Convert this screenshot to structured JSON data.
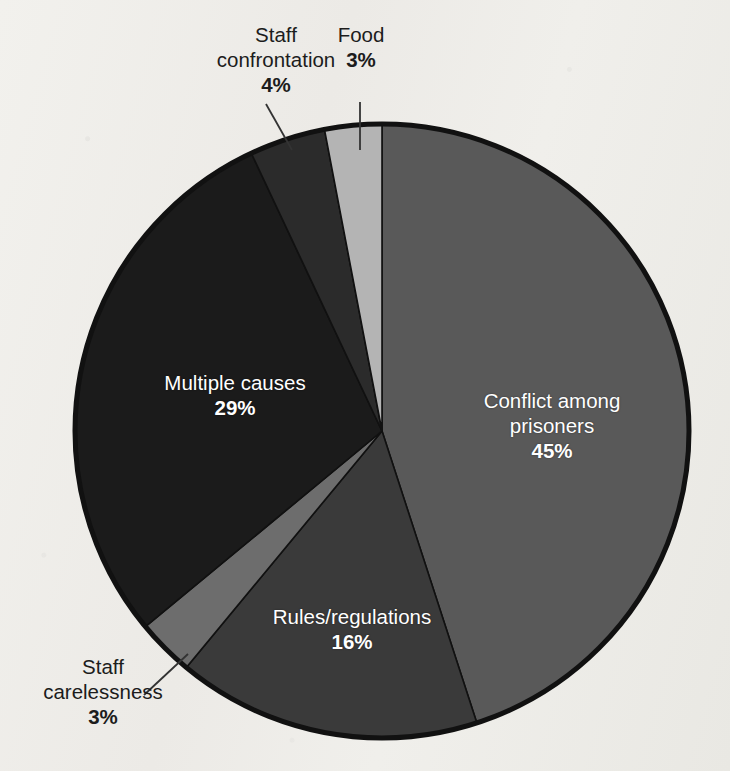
{
  "chart_data": {
    "type": "pie",
    "title": "",
    "subtitle": "",
    "xlabel": "",
    "ylabel": "",
    "legend_position": "none",
    "grid": false,
    "units": "percent",
    "total": 100,
    "categories": [
      "Conflict among prisoners",
      "Rules/regulations",
      "Staff carelessness",
      "Multiple causes",
      "Staff confrontation",
      "Food"
    ],
    "values": [
      45,
      16,
      3,
      29,
      4,
      3
    ],
    "slices": [
      {
        "id": "conflict",
        "label": "Conflict among prisoners",
        "label_line1": "Conflict among",
        "label_line2": "prisoners",
        "value": 45,
        "percent_text": "45%",
        "color": "#595959",
        "label_placement": "inside",
        "label_color": "#ffffff"
      },
      {
        "id": "rules",
        "label": "Rules/regulations",
        "label_line1": "Rules/regulations",
        "label_line2": "",
        "value": 16,
        "percent_text": "16%",
        "color": "#3a3a3a",
        "label_placement": "inside",
        "label_color": "#ffffff"
      },
      {
        "id": "staff-carelessness",
        "label": "Staff carelessness",
        "label_line1": "Staff",
        "label_line2": "carelessness",
        "value": 3,
        "percent_text": "3%",
        "color": "#6d6d6d",
        "label_placement": "outside",
        "label_color": "#1c1c1c"
      },
      {
        "id": "multiple",
        "label": "Multiple causes",
        "label_line1": "Multiple causes",
        "label_line2": "",
        "value": 29,
        "percent_text": "29%",
        "color": "#1b1b1b",
        "label_placement": "inside",
        "label_color": "#ffffff"
      },
      {
        "id": "staff-confrontation",
        "label": "Staff confrontation",
        "label_line1": "Staff",
        "label_line2": "confrontation",
        "value": 4,
        "percent_text": "4%",
        "color": "#2b2b2b",
        "label_placement": "outside",
        "label_color": "#1c1c1c"
      },
      {
        "id": "food",
        "label": "Food",
        "label_line1": "Food",
        "label_line2": "",
        "value": 3,
        "percent_text": "3%",
        "color": "#b4b4b4",
        "label_placement": "outside",
        "label_color": "#1c1c1c"
      }
    ],
    "geometry": {
      "center_x": 382,
      "center_y": 431,
      "radius": 307,
      "start_angle_deg": 0,
      "direction": "clockwise"
    },
    "style": {
      "background": "#efeeea",
      "outline_color": "#111111",
      "outline_width": 5,
      "separator_color": "#111111",
      "leader_line_color": "#333333"
    }
  }
}
